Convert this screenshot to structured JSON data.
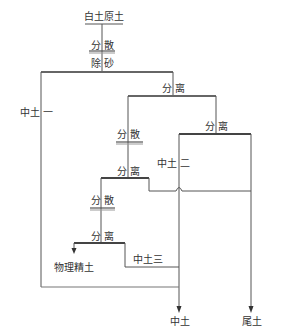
{
  "diagram": {
    "title": "白土原土",
    "steps": {
      "disperse_1": "分 散",
      "desand": "除 砂",
      "separate_1": "分 离",
      "disperse_2": "分 散",
      "separate_2": "分 离",
      "separate_3": "分 离",
      "disperse_3": "分 散",
      "separate_4": "分 离"
    },
    "products": {
      "middle_1": "中土 一",
      "middle_2": "中土 二",
      "middle_3": "中土三",
      "refined": "物理精土",
      "middle_out": "中土",
      "tailings": "尾土"
    },
    "colors": {
      "line": "#555555",
      "bar": "#666666",
      "text": "#333333"
    }
  }
}
